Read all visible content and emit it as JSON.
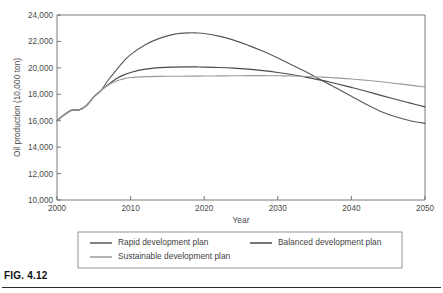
{
  "figure": {
    "caption": "FIG. 4.12"
  },
  "chart_data": {
    "type": "line",
    "title": "",
    "xlabel": "Year",
    "ylabel": "Oil production (10,000 ton)",
    "xlim": [
      2000,
      2050
    ],
    "ylim": [
      10000,
      24000
    ],
    "xticks": [
      "2000",
      "2010",
      "2020",
      "2030",
      "2040",
      "2050"
    ],
    "yticks": [
      "10,000",
      "12,000",
      "14,000",
      "16,000",
      "18,000",
      "20,000",
      "22,000",
      "24,000"
    ],
    "grid": false,
    "legend_position": "bottom",
    "x": [
      2000,
      2001,
      2002,
      2003,
      2004,
      2005,
      2006,
      2007,
      2008,
      2009,
      2010,
      2012,
      2014,
      2016,
      2018,
      2019,
      2020,
      2022,
      2024,
      2026,
      2028,
      2030,
      2032,
      2034,
      2036,
      2037,
      2038,
      2040,
      2042,
      2044,
      2046,
      2048,
      2050
    ],
    "series": [
      {
        "name": "Rapid development plan",
        "color": "#595959",
        "values": [
          16000,
          16450,
          16800,
          16820,
          17150,
          17800,
          18300,
          19100,
          19800,
          20450,
          21000,
          21750,
          22250,
          22550,
          22650,
          22640,
          22600,
          22400,
          22100,
          21700,
          21250,
          20750,
          20200,
          19650,
          19050,
          18750,
          18450,
          17850,
          17250,
          16700,
          16300,
          16000,
          15800
        ]
      },
      {
        "name": "Balanced development plan",
        "color": "#4a4a4a",
        "values": [
          16000,
          16450,
          16800,
          16820,
          17150,
          17800,
          18300,
          18750,
          19150,
          19450,
          19650,
          19900,
          20020,
          20060,
          20070,
          20070,
          20060,
          20030,
          19980,
          19900,
          19790,
          19650,
          19480,
          19280,
          19050,
          18930,
          18800,
          18520,
          18230,
          17920,
          17620,
          17330,
          17050
        ]
      },
      {
        "name": "Sustainable development plan",
        "color": "#9a9a9a",
        "values": [
          16000,
          16450,
          16800,
          16820,
          17150,
          17800,
          18300,
          18700,
          18980,
          19170,
          19270,
          19340,
          19360,
          19365,
          19370,
          19375,
          19380,
          19390,
          19400,
          19410,
          19410,
          19400,
          19380,
          19350,
          19300,
          19270,
          19240,
          19160,
          19060,
          18950,
          18820,
          18690,
          18550
        ]
      }
    ]
  },
  "legend": {
    "entries": [
      {
        "label": "Rapid development plan",
        "color": "#595959"
      },
      {
        "label": "Balanced development plan",
        "color": "#4a4a4a"
      },
      {
        "label": "Sustainable development plan",
        "color": "#9a9a9a"
      }
    ]
  }
}
